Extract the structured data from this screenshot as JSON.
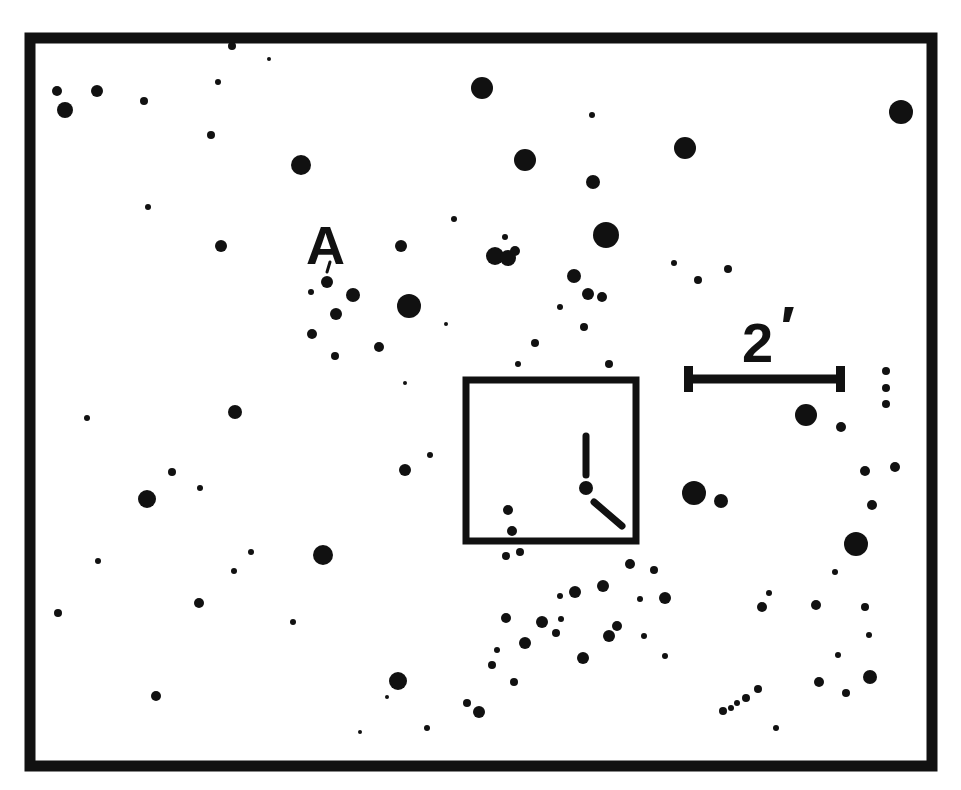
{
  "chart": {
    "type": "finder-chart",
    "background": "#ffffff",
    "ink": "#111111",
    "frame": {
      "x": 30,
      "y": 38,
      "w": 902,
      "h": 728,
      "stroke": 11
    }
  },
  "labels": {
    "star_label": "A",
    "scale_value": "2",
    "scale_unit": "′"
  },
  "scale_bar": {
    "x1": 688,
    "x2": 840,
    "y": 379,
    "cap_height": 26,
    "thickness": 9
  },
  "target_box": {
    "x": 466,
    "y": 380,
    "w": 170,
    "h": 161,
    "stroke": 7,
    "marker": {
      "center": [
        586,
        488
      ],
      "north_tick": [
        [
          586,
          436
        ],
        [
          586,
          475
        ]
      ],
      "southeast_tick": [
        [
          594,
          502
        ],
        [
          622,
          526
        ]
      ]
    }
  },
  "star_label_tick": [
    [
      330,
      262
    ],
    [
      327,
      272
    ]
  ],
  "stars": [
    [
      57,
      91,
      5
    ],
    [
      65,
      110,
      8
    ],
    [
      97,
      91,
      6
    ],
    [
      144,
      101,
      4
    ],
    [
      218,
      82,
      3
    ],
    [
      232,
      46,
      4
    ],
    [
      269,
      59,
      2
    ],
    [
      211,
      135,
      4
    ],
    [
      148,
      207,
      3
    ],
    [
      221,
      246,
      6
    ],
    [
      301,
      165,
      10
    ],
    [
      482,
      88,
      11
    ],
    [
      592,
      115,
      3
    ],
    [
      525,
      160,
      11
    ],
    [
      685,
      148,
      11
    ],
    [
      593,
      182,
      7
    ],
    [
      901,
      112,
      12
    ],
    [
      606,
      235,
      13
    ],
    [
      454,
      219,
      3
    ],
    [
      505,
      237,
      3
    ],
    [
      495,
      256,
      9
    ],
    [
      508,
      258,
      8
    ],
    [
      515,
      251,
      5
    ],
    [
      401,
      246,
      6
    ],
    [
      674,
      263,
      3
    ],
    [
      698,
      280,
      4
    ],
    [
      728,
      269,
      4
    ],
    [
      327,
      282,
      6
    ],
    [
      311,
      292,
      3
    ],
    [
      353,
      295,
      7
    ],
    [
      409,
      306,
      12
    ],
    [
      336,
      314,
      6
    ],
    [
      312,
      334,
      5
    ],
    [
      335,
      356,
      4
    ],
    [
      379,
      347,
      5
    ],
    [
      446,
      324,
      2
    ],
    [
      574,
      276,
      7
    ],
    [
      588,
      294,
      6
    ],
    [
      602,
      297,
      5
    ],
    [
      560,
      307,
      3
    ],
    [
      584,
      327,
      4
    ],
    [
      535,
      343,
      4
    ],
    [
      518,
      364,
      3
    ],
    [
      609,
      364,
      4
    ],
    [
      405,
      383,
      2
    ],
    [
      87,
      418,
      3
    ],
    [
      235,
      412,
      7
    ],
    [
      430,
      455,
      3
    ],
    [
      172,
      472,
      4
    ],
    [
      200,
      488,
      3
    ],
    [
      147,
      499,
      9
    ],
    [
      405,
      470,
      6
    ],
    [
      98,
      561,
      3
    ],
    [
      234,
      571,
      3
    ],
    [
      251,
      552,
      3
    ],
    [
      323,
      555,
      10
    ],
    [
      199,
      603,
      5
    ],
    [
      58,
      613,
      4
    ],
    [
      293,
      622,
      3
    ],
    [
      156,
      696,
      5
    ],
    [
      398,
      681,
      9
    ],
    [
      387,
      697,
      2
    ],
    [
      360,
      732,
      2
    ],
    [
      427,
      728,
      3
    ],
    [
      508,
      510,
      5
    ],
    [
      512,
      531,
      5
    ],
    [
      506,
      556,
      4
    ],
    [
      520,
      552,
      4
    ],
    [
      630,
      564,
      5
    ],
    [
      654,
      570,
      4
    ],
    [
      575,
      592,
      6
    ],
    [
      603,
      586,
      6
    ],
    [
      640,
      599,
      3
    ],
    [
      665,
      598,
      6
    ],
    [
      560,
      596,
      3
    ],
    [
      506,
      618,
      5
    ],
    [
      542,
      622,
      6
    ],
    [
      561,
      619,
      3
    ],
    [
      556,
      633,
      4
    ],
    [
      525,
      643,
      6
    ],
    [
      609,
      636,
      6
    ],
    [
      617,
      626,
      5
    ],
    [
      644,
      636,
      3
    ],
    [
      497,
      650,
      3
    ],
    [
      492,
      665,
      4
    ],
    [
      583,
      658,
      6
    ],
    [
      665,
      656,
      3
    ],
    [
      514,
      682,
      4
    ],
    [
      467,
      703,
      4
    ],
    [
      479,
      712,
      6
    ],
    [
      694,
      493,
      12
    ],
    [
      721,
      501,
      7
    ],
    [
      806,
      415,
      11
    ],
    [
      841,
      427,
      5
    ],
    [
      886,
      371,
      4
    ],
    [
      886,
      388,
      4
    ],
    [
      886,
      404,
      4
    ],
    [
      865,
      471,
      5
    ],
    [
      895,
      467,
      5
    ],
    [
      872,
      505,
      5
    ],
    [
      856,
      544,
      12
    ],
    [
      835,
      572,
      3
    ],
    [
      769,
      593,
      3
    ],
    [
      762,
      607,
      5
    ],
    [
      816,
      605,
      5
    ],
    [
      865,
      607,
      4
    ],
    [
      869,
      635,
      3
    ],
    [
      838,
      655,
      3
    ],
    [
      819,
      682,
      5
    ],
    [
      870,
      677,
      7
    ],
    [
      846,
      693,
      4
    ],
    [
      723,
      711,
      4
    ],
    [
      731,
      708,
      3
    ],
    [
      737,
      703,
      3
    ],
    [
      746,
      698,
      4
    ],
    [
      758,
      689,
      4
    ],
    [
      776,
      728,
      3
    ]
  ]
}
